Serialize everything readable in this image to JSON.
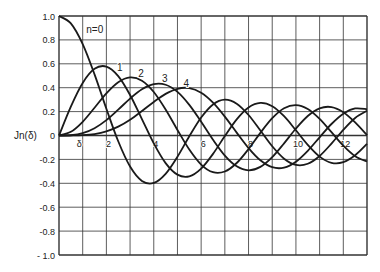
{
  "chart_data": {
    "type": "line",
    "title": "",
    "xlabel": "δ",
    "ylabel": "Jn(δ)",
    "xlim": [
      0,
      13
    ],
    "ylim": [
      -1.0,
      1.0
    ],
    "grid": true,
    "legend": "inline curve labels",
    "x_ticks": [
      2,
      4,
      6,
      8,
      10,
      12
    ],
    "x_tick_labels": [
      "2",
      "4",
      "6",
      "8",
      "10",
      "12"
    ],
    "y_ticks": [
      1.0,
      0.8,
      0.6,
      0.4,
      0.2,
      0,
      -0.2,
      -0.4,
      -0.6,
      -0.8,
      -1.0
    ],
    "y_tick_labels": [
      "1.0",
      "0.8",
      "0.6",
      "0.4",
      "0.2",
      "0",
      "-0.2",
      "-0.4",
      "-0.6",
      "-0.8",
      "- 1.0"
    ],
    "x": [
      0,
      0.5,
      1,
      1.5,
      2,
      2.5,
      3,
      3.5,
      4,
      4.5,
      5,
      5.5,
      6,
      6.5,
      7,
      7.5,
      8,
      8.5,
      9,
      9.5,
      10,
      10.5,
      11,
      11.5,
      12,
      12.5,
      13
    ],
    "series": [
      {
        "name": "n=0",
        "label": "n=0",
        "label_pos": [
          1.15,
          0.86
        ],
        "values": [
          1,
          0.9385,
          0.7652,
          0.5118,
          0.2239,
          -0.0484,
          -0.2601,
          -0.3801,
          -0.3971,
          -0.3205,
          -0.1776,
          -0.0068,
          0.1506,
          0.2601,
          0.3001,
          0.2663,
          0.1717,
          0.0419,
          -0.0903,
          -0.1939,
          -0.2459,
          -0.2366,
          -0.1712,
          -0.0677,
          0.0477,
          0.1469,
          0.2069
        ]
      },
      {
        "name": "n=1",
        "label": "1",
        "label_pos": [
          2.45,
          0.54
        ],
        "values": [
          0,
          0.2423,
          0.4401,
          0.5579,
          0.5767,
          0.4971,
          0.3391,
          0.1374,
          -0.066,
          -0.2311,
          -0.3276,
          -0.3414,
          -0.2767,
          -0.1538,
          -0.0047,
          0.1352,
          0.2346,
          0.2731,
          0.2453,
          0.1613,
          0.0435,
          -0.0789,
          -0.1768,
          -0.2284,
          -0.2234,
          -0.1655,
          -0.0703
        ]
      },
      {
        "name": "n=2",
        "label": "2",
        "label_pos": [
          3.35,
          0.49
        ],
        "values": [
          0,
          0.0306,
          0.1149,
          0.2321,
          0.3528,
          0.4461,
          0.4861,
          0.4586,
          0.3641,
          0.2178,
          0.0466,
          -0.1173,
          -0.2429,
          -0.3074,
          -0.3014,
          -0.2303,
          -0.113,
          0.0223,
          0.1448,
          0.2279,
          0.2546,
          0.2216,
          0.139,
          0.0279,
          -0.0849,
          -0.1734,
          -0.2177
        ]
      },
      {
        "name": "n=3",
        "label": "3",
        "label_pos": [
          4.35,
          0.45
        ],
        "values": [
          0,
          0.0026,
          0.0196,
          0.061,
          0.1289,
          0.2166,
          0.3091,
          0.3868,
          0.4302,
          0.4247,
          0.3648,
          0.2561,
          0.1148,
          -0.0353,
          -0.1676,
          -0.2581,
          -0.2911,
          -0.2626,
          -0.1809,
          -0.0653,
          0.0584,
          0.1633,
          0.2273,
          0.2381,
          0.1951,
          0.11,
          0.0033
        ]
      },
      {
        "name": "n=4",
        "label": "4",
        "label_pos": [
          5.25,
          0.41
        ],
        "values": [
          0,
          0.0002,
          0.0025,
          0.0118,
          0.034,
          0.0738,
          0.132,
          0.2044,
          0.2811,
          0.3484,
          0.3912,
          0.3967,
          0.3576,
          0.2748,
          0.1578,
          0.0238,
          -0.1054,
          -0.2077,
          -0.2655,
          -0.2691,
          -0.2196,
          -0.1284,
          -0.015,
          0.0963,
          0.1825,
          0.2262,
          0.2193
        ]
      }
    ]
  },
  "colors": {
    "line": "#1a1a1a",
    "grid": "#333333",
    "background": "#ffffff"
  }
}
